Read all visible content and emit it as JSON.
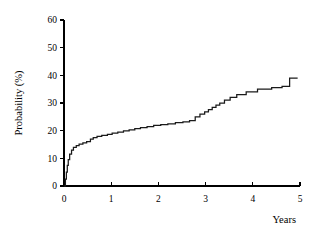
{
  "chart_data": {
    "type": "line",
    "title": "",
    "subtitle": "",
    "xlabel": "Years",
    "ylabel": "Probability (%)",
    "xlim": [
      0,
      5
    ],
    "ylim": [
      0,
      60
    ],
    "xticks": [
      0,
      1,
      2,
      3,
      4,
      5
    ],
    "xtick_labels": [
      "0",
      "1",
      "2",
      "3",
      "4",
      "5"
    ],
    "yticks": [
      0,
      10,
      20,
      30,
      40,
      50,
      60
    ],
    "ytick_labels": [
      "0",
      "10",
      "20",
      "30",
      "40",
      "50",
      "60"
    ],
    "grid": false,
    "legend": false,
    "legend_position": "none",
    "line_color": "#1a1a1a",
    "background_color": "#ffffff",
    "step_style": "post",
    "series": [
      {
        "name": "Cumulative incidence",
        "x": [
          0.0,
          0.03,
          0.05,
          0.07,
          0.09,
          0.12,
          0.16,
          0.2,
          0.26,
          0.32,
          0.4,
          0.48,
          0.56,
          0.62,
          0.7,
          0.8,
          0.92,
          1.02,
          1.14,
          1.26,
          1.38,
          1.5,
          1.62,
          1.76,
          1.9,
          2.05,
          2.2,
          2.36,
          2.52,
          2.66,
          2.78,
          2.88,
          2.98,
          3.06,
          3.14,
          3.22,
          3.3,
          3.4,
          3.52,
          3.66,
          3.86,
          4.1,
          4.4,
          4.62,
          4.78,
          4.95
        ],
        "y": [
          0.0,
          2.5,
          5.0,
          7.5,
          9.5,
          11.5,
          13.0,
          14.0,
          14.6,
          15.1,
          15.6,
          16.0,
          16.9,
          17.5,
          17.9,
          18.3,
          18.7,
          19.1,
          19.5,
          19.9,
          20.3,
          20.7,
          21.1,
          21.5,
          21.9,
          22.2,
          22.5,
          22.9,
          23.2,
          23.6,
          25.0,
          26.0,
          26.8,
          27.6,
          28.4,
          29.2,
          30.0,
          31.0,
          32.0,
          33.0,
          34.0,
          35.0,
          35.6,
          36.0,
          39.0,
          39.0
        ]
      }
    ]
  }
}
